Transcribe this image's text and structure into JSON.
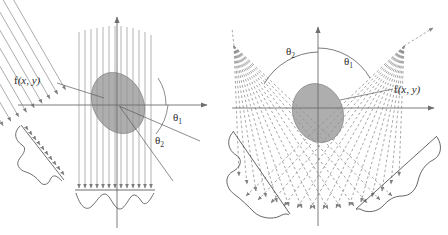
{
  "figure": {
    "background_color": "#ffffff",
    "width": 448,
    "height": 235
  },
  "colors": {
    "axis": "#6e6e6e",
    "ray": "#8c8c8c",
    "ray_dashed": "#8a8a8a",
    "object_fill": "#8f8f8f",
    "object_stroke": "#7a7a7a",
    "profile_curve": "#4a4a4a",
    "leader_line": "#5a5a5a",
    "text": "#2b2b2b"
  },
  "panels": [
    {
      "id": "parallel-beam",
      "name": "Parallel beam projection",
      "origin": {
        "x": 117,
        "y": 105
      },
      "axes": {
        "x_axis": {
          "x1": 18,
          "y1": 105,
          "x2": 212,
          "y2": 105,
          "arrow": "right"
        },
        "y_axis": {
          "x1": 117,
          "y1": 228,
          "x2": 117,
          "y2": 12,
          "arrow": "up"
        }
      },
      "object": {
        "label": "f(x, y)",
        "label_x": 14,
        "label_y": 84,
        "cx": 118,
        "cy": 103,
        "rx": 25,
        "ry": 32,
        "rotation": -28
      },
      "angles": [
        {
          "label": "θ",
          "subscript": "1",
          "value_deg": 90,
          "label_x": 173,
          "label_y": 120
        },
        {
          "label": "θ",
          "subscript": "2",
          "value_deg": 30,
          "label_x": 155,
          "label_y": 143
        }
      ],
      "beams": [
        {
          "name": "beam-set-vertical",
          "angle_deg": 90,
          "count": 13,
          "style": "solid-arrow"
        },
        {
          "name": "beam-set-tilted",
          "angle_deg": 30,
          "count": 15,
          "style": "solid-arrow"
        }
      ],
      "profiles": [
        {
          "name": "profile-tilted",
          "position": "lower-left",
          "angle_deg": 30
        },
        {
          "name": "profile-vertical",
          "position": "bottom",
          "angle_deg": 90
        }
      ]
    },
    {
      "id": "fan-beam",
      "name": "Fan beam projection",
      "origin": {
        "x": 318,
        "y": 108
      },
      "axes": {
        "x_axis": {
          "x1": 232,
          "y1": 108,
          "x2": 438,
          "y2": 108,
          "arrow": "right"
        },
        "y_axis": {
          "x1": 318,
          "y1": 226,
          "x2": 318,
          "y2": 22,
          "arrow": "up"
        }
      },
      "object": {
        "label": "f(x, y)",
        "label_x": 396,
        "label_y": 92,
        "cx": 318,
        "cy": 113,
        "rx": 25,
        "ry": 30,
        "rotation": -20
      },
      "angles": [
        {
          "label": "θ",
          "subscript": "1",
          "value_deg": 35,
          "label_x": 344,
          "label_y": 64
        },
        {
          "label": "θ",
          "subscript": "2",
          "value_deg": 145,
          "label_x": 288,
          "label_y": 54
        }
      ],
      "beams": [
        {
          "name": "fan-set-right",
          "source_x": 404,
          "source_y": 46,
          "count": 15,
          "style": "dashed"
        },
        {
          "name": "fan-set-left",
          "source_x": 234,
          "source_y": 46,
          "count": 15,
          "style": "dashed"
        }
      ],
      "profiles": [
        {
          "name": "profile-lower-left",
          "position": "lower-left"
        },
        {
          "name": "profile-lower-right",
          "position": "lower-right"
        }
      ]
    }
  ]
}
